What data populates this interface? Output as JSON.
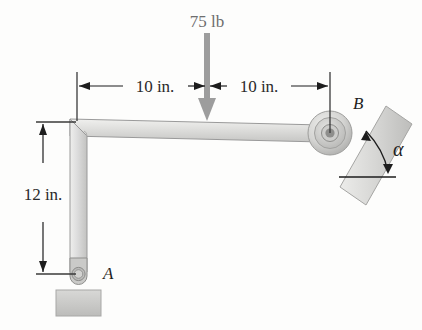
{
  "figure": {
    "background_color": "#fdfdfc"
  },
  "load": {
    "label": "75 lb",
    "magnitude": 75,
    "units": "lb",
    "direction": "downward",
    "arrow_color": "#9d9d9d",
    "applied_at": "midpoint of horizontal member"
  },
  "dimensions": [
    {
      "name": "left-span",
      "label": "10 in.",
      "value": 10,
      "units": "in.",
      "orientation": "horizontal"
    },
    {
      "name": "right-span",
      "label": "10 in.",
      "value": 10,
      "units": "in.",
      "orientation": "horizontal"
    },
    {
      "name": "vertical-height",
      "label": "12 in.",
      "value": 12,
      "units": "in.",
      "orientation": "vertical"
    }
  ],
  "points": {
    "a": {
      "label": "A",
      "type": "pin-support"
    },
    "b": {
      "label": "B",
      "type": "roller-on-incline"
    }
  },
  "angle": {
    "label": "α",
    "name": "alpha",
    "description": "inclination of surface from horizontal"
  },
  "colors": {
    "member_fill_light": "#e6e6e4",
    "member_fill_mid": "#cfcfcd",
    "member_edge": "#9a9a9a",
    "incline_fill": "#d3d3d1",
    "base_fill": "#c8c8c6",
    "line_dark": "#1d1d1d",
    "arrow_gray": "#9d9d9d"
  }
}
